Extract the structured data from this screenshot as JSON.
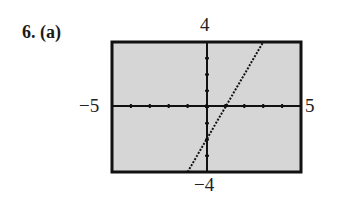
{
  "heading": "6.  (a)",
  "chart_data": {
    "type": "line",
    "title": "6. (a)",
    "xlabel": "",
    "ylabel": "",
    "xlim": [
      -5,
      5
    ],
    "ylim": [
      -4,
      4
    ],
    "window_labels": {
      "xmin": "−5",
      "xmax": "5",
      "ymin": "−4",
      "ymax": "4"
    },
    "grid": false,
    "x_ticks": [
      -5,
      -4,
      -3,
      -2,
      -1,
      0,
      1,
      2,
      3,
      4,
      5
    ],
    "y_ticks": [
      -4,
      -3,
      -2,
      -1,
      0,
      1,
      2,
      3,
      4
    ],
    "series": [
      {
        "name": "y = 2x - 2",
        "x": [
          -1,
          3
        ],
        "y": [
          -4,
          4
        ],
        "style": "dotted"
      }
    ],
    "background": "#d9d9d9",
    "line_color": "#111111"
  }
}
